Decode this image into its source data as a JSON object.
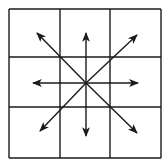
{
  "diagram": {
    "title": "",
    "grid": {
      "rows": 3,
      "cols": 3,
      "x0": 9,
      "y0": 9,
      "x1": 161,
      "y1": 158,
      "v_lines": [
        9,
        60,
        110,
        161
      ],
      "h_lines": [
        9,
        57,
        107,
        158
      ]
    },
    "center": {
      "x": 86,
      "y": 83
    },
    "arrows": [
      {
        "name": "north",
        "tip": [
          86,
          33
        ]
      },
      {
        "name": "south",
        "tip": [
          86,
          136
        ]
      },
      {
        "name": "east",
        "tip": [
          138,
          83
        ]
      },
      {
        "name": "west",
        "tip": [
          33,
          83
        ]
      },
      {
        "name": "northeast",
        "tip": [
          137,
          35
        ]
      },
      {
        "name": "northwest",
        "tip": [
          37,
          33
        ]
      },
      {
        "name": "southeast",
        "tip": [
          137,
          133
        ]
      },
      {
        "name": "southwest",
        "tip": [
          40,
          131
        ]
      }
    ],
    "colors": {
      "line": "#1a1a1a",
      "background": "#ffffff"
    }
  }
}
